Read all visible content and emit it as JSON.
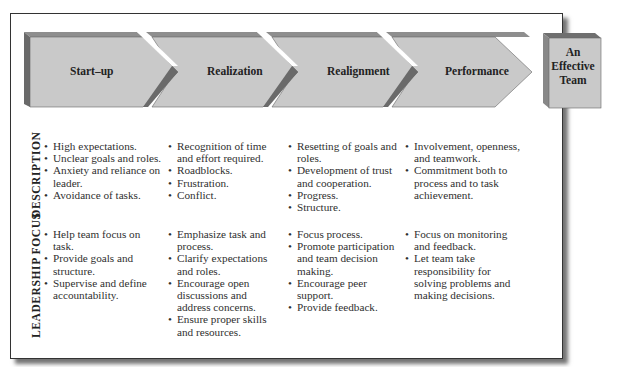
{
  "diagram": {
    "stages": [
      {
        "label": "Start–up"
      },
      {
        "label": "Realization"
      },
      {
        "label": "Realignment"
      },
      {
        "label": "Performance"
      }
    ],
    "goal": {
      "lines": [
        "An",
        "Effective",
        "Team"
      ]
    },
    "colors": {
      "arrow_face": "#c9c9c9",
      "arrow_top": "#8e8e8e",
      "arrow_side": "#6a6a6a",
      "frame_border": "#333333"
    }
  },
  "rows": {
    "description": {
      "label": "DESCRIPTION",
      "columns": [
        [
          "High expectations.",
          "Unclear goals and roles.",
          "Anxiety and reliance on leader.",
          "Avoidance of tasks."
        ],
        [
          "Recognition of time and effort required.",
          "Roadblocks.",
          "Frustration.",
          "Conflict."
        ],
        [
          "Resetting of goals and roles.",
          "Development of trust and cooperation.",
          "Progress.",
          "Structure."
        ],
        [
          "Involvement, openness, and teamwork.",
          "Commitment both to process and to task achievement."
        ]
      ]
    },
    "leadership": {
      "label": "LEADERSHIP FOCUS",
      "columns": [
        [
          "Help team focus on task.",
          "Provide goals and structure.",
          "Supervise and define accountability."
        ],
        [
          "Emphasize task and process.",
          "Clarify expectations and roles.",
          "Encourage open discussions and address concerns.",
          "Ensure proper skills and resources."
        ],
        [
          "Focus process.",
          "Promote participation and team decision making.",
          "Encourage peer support.",
          "Provide feedback."
        ],
        [
          "Focus on monitoring and feedback.",
          "Let team take responsibility for solving problems and making decisions."
        ]
      ]
    }
  }
}
